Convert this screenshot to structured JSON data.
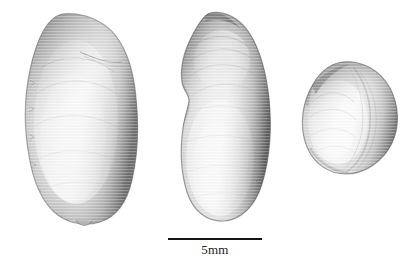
{
  "figure": {
    "background_color": "#ffffff",
    "caption": "",
    "specimen_count": 3
  },
  "scale_bar": {
    "label": "5mm",
    "length_value": 5,
    "length_unit": "mm",
    "line_color": "#141414",
    "line_length_px": 94,
    "name": "scale-bar"
  },
  "specimens": [
    {
      "id": "specimen-1",
      "view": "lateral-left-valve",
      "shape": "elongate-ovoid",
      "bounds": {
        "x": 20,
        "y": 12,
        "width": 120,
        "height": 210
      },
      "fill_light": "#f2f2f2",
      "fill_mid": "#d8d8d8",
      "fill_shadow": "#8e8e8e",
      "edge_dark": "#5a5a5a"
    },
    {
      "id": "specimen-2",
      "view": "lateral-right-valve",
      "shape": "reniform-bean",
      "bounds": {
        "x": 178,
        "y": 12,
        "width": 92,
        "height": 208
      },
      "fill_light": "#f4f4f4",
      "fill_mid": "#dcdcdc",
      "fill_shadow": "#8a8a8a",
      "edge_dark": "#4f4f4f"
    },
    {
      "id": "specimen-3",
      "view": "dorsal-oblique",
      "shape": "rounded-ovoid",
      "bounds": {
        "x": 300,
        "y": 62,
        "width": 98,
        "height": 113
      },
      "fill_light": "#f2f2f2",
      "fill_mid": "#d6d6d6",
      "fill_shadow": "#8c8c8c",
      "edge_dark": "#565656"
    }
  ]
}
